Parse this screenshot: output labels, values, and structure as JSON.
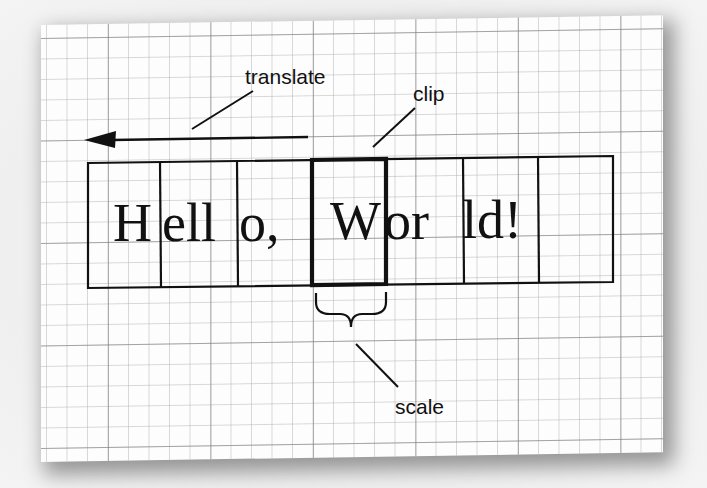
{
  "diagram": {
    "type": "annotated-illustration",
    "background": "graph-paper",
    "text_row": {
      "full_text": "Hello, World!",
      "cells": [
        {
          "index": 0,
          "glyphs": "H"
        },
        {
          "index": 1,
          "glyphs": "ell"
        },
        {
          "index": 2,
          "glyphs": "o,"
        },
        {
          "index": 3,
          "glyphs": "W",
          "highlighted": true
        },
        {
          "index": 4,
          "glyphs": "or"
        },
        {
          "index": 5,
          "glyphs": "ld!"
        },
        {
          "index": 6,
          "glyphs": ""
        }
      ],
      "segments": [
        "H",
        "ell",
        "o,",
        "W",
        "or",
        "ld!"
      ]
    },
    "annotations": {
      "translate": {
        "label": "translate",
        "pointer": "leftward-arrow"
      },
      "clip": {
        "label": "clip",
        "pointer": "highlighted-cell-border"
      },
      "scale": {
        "label": "scale",
        "pointer": "curly-brace-under-cell"
      }
    },
    "colors": {
      "ink": "#111111",
      "paper": "#fdfdfd",
      "grid_minor": "#aaaaaa",
      "grid_major": "#787878"
    }
  }
}
